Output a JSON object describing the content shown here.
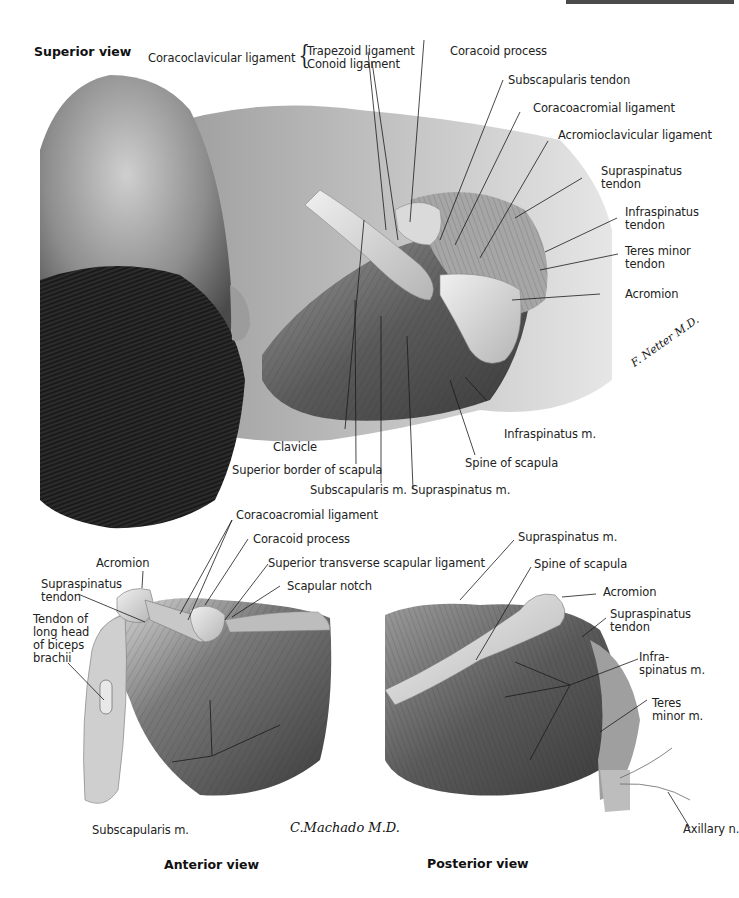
{
  "figure": {
    "colors": {
      "background": "#ffffff",
      "ink": "#222222",
      "top_bar": "#4a4a4a"
    },
    "panels": [
      {
        "id": "superior",
        "title": "Superior view",
        "labels": [
          {
            "text": "Coracoclavicular ligament",
            "group": "coracoclavicular"
          },
          {
            "text": "Trapezoid ligament"
          },
          {
            "text": "Conoid ligament"
          },
          {
            "text": "Coracoid process"
          },
          {
            "text": "Subscapularis tendon"
          },
          {
            "text": "Coracoacromial ligament"
          },
          {
            "text": "Acromioclavicular ligament"
          },
          {
            "text": "Supraspinatus\ntendon"
          },
          {
            "text": "Infraspinatus\ntendon"
          },
          {
            "text": "Teres minor\ntendon"
          },
          {
            "text": "Acromion"
          },
          {
            "text": "Infraspinatus m."
          },
          {
            "text": "Clavicle"
          },
          {
            "text": "Spine of scapula"
          },
          {
            "text": "Superior border of scapula"
          },
          {
            "text": "Subscapularis m."
          },
          {
            "text": "Supraspinatus m."
          }
        ],
        "signature": "F. Netter M.D."
      },
      {
        "id": "anterior",
        "title": "Anterior view",
        "labels": [
          {
            "text": "Coracoacromial ligament"
          },
          {
            "text": "Coracoid process"
          },
          {
            "text": "Acromion"
          },
          {
            "text": "Superior transverse scapular ligament"
          },
          {
            "text": "Supraspinatus\ntendon"
          },
          {
            "text": "Scapular notch"
          },
          {
            "text": "Tendon of\nlong head\nof biceps\nbrachii"
          },
          {
            "text": "Subscapularis m."
          }
        ],
        "signature": "C.Machado M.D."
      },
      {
        "id": "posterior",
        "title": "Posterior view",
        "labels": [
          {
            "text": "Supraspinatus m."
          },
          {
            "text": "Spine of scapula"
          },
          {
            "text": "Acromion"
          },
          {
            "text": "Supraspinatus\ntendon"
          },
          {
            "text": "Infra-\nspinatus m."
          },
          {
            "text": "Teres\nminor m."
          },
          {
            "text": "Axillary n."
          }
        ]
      }
    ]
  }
}
